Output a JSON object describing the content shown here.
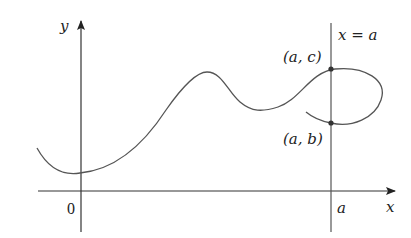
{
  "figure": {
    "axes": {
      "x_label": "x",
      "y_label": "y",
      "origin_label": "0",
      "a_tick_label": "a"
    },
    "vertical_line": {
      "label": "x = a"
    },
    "points": [
      {
        "label": "(a, c)"
      },
      {
        "label": "(a, b)"
      }
    ],
    "colors": {
      "axis": "#333333",
      "curve": "#555555",
      "point": "#333333"
    }
  }
}
